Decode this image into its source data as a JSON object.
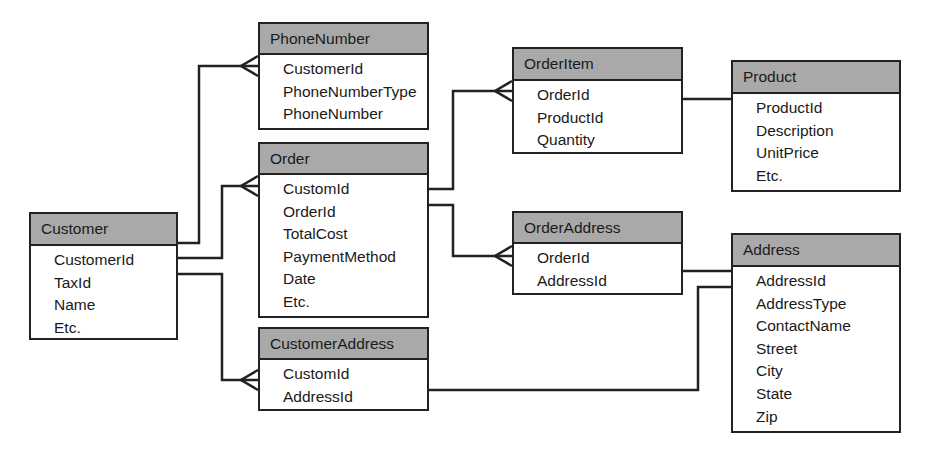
{
  "diagram": {
    "type": "entity-relationship",
    "entities": [
      {
        "id": "customer",
        "title": "Customer",
        "fields": [
          "CustomerId",
          "TaxId",
          "Name",
          "Etc."
        ],
        "box": {
          "x": 29,
          "y": 212,
          "w": 149,
          "h": 128,
          "header_h": 32
        }
      },
      {
        "id": "phonenumber",
        "title": "PhoneNumber",
        "fields": [
          "CustomerId",
          "PhoneNumberType",
          "PhoneNumber"
        ],
        "box": {
          "x": 258,
          "y": 22,
          "w": 171,
          "h": 108,
          "header_h": 31
        }
      },
      {
        "id": "order",
        "title": "Order",
        "fields": [
          "CustomId",
          "OrderId",
          "TotalCost",
          "PaymentMethod",
          "Date",
          "Etc."
        ],
        "box": {
          "x": 258,
          "y": 142,
          "w": 171,
          "h": 176,
          "header_h": 31
        }
      },
      {
        "id": "customeraddress",
        "title": "CustomerAddress",
        "fields": [
          "CustomId",
          "AddressId"
        ],
        "box": {
          "x": 258,
          "y": 327,
          "w": 171,
          "h": 84,
          "header_h": 31
        }
      },
      {
        "id": "orderitem",
        "title": "OrderItem",
        "fields": [
          "OrderId",
          "ProductId",
          "Quantity"
        ],
        "box": {
          "x": 512,
          "y": 47,
          "w": 171,
          "h": 107,
          "header_h": 32
        }
      },
      {
        "id": "orderaddress",
        "title": "OrderAddress",
        "fields": [
          "OrderId",
          "AddressId"
        ],
        "box": {
          "x": 512,
          "y": 211,
          "w": 171,
          "h": 84,
          "header_h": 31
        }
      },
      {
        "id": "product",
        "title": "Product",
        "fields": [
          "ProductId",
          "Description",
          "UnitPrice",
          "Etc."
        ],
        "box": {
          "x": 731,
          "y": 60,
          "w": 170,
          "h": 132,
          "header_h": 32
        }
      },
      {
        "id": "address",
        "title": "Address",
        "fields": [
          "AddressId",
          "AddressType",
          "ContactName",
          "Street",
          "City",
          "State",
          "Zip"
        ],
        "box": {
          "x": 731,
          "y": 233,
          "w": 170,
          "h": 200,
          "header_h": 32
        }
      }
    ],
    "relationships": [
      {
        "from": "Customer",
        "to": "PhoneNumber",
        "cardinality": "one-to-many",
        "path": "M178 243 H199 V66 H258",
        "crow": {
          "x": 258,
          "y": 66
        }
      },
      {
        "from": "Customer",
        "to": "Order",
        "cardinality": "one-to-many",
        "path": "M178 258 H222 V186 H258",
        "crow": {
          "x": 258,
          "y": 186
        }
      },
      {
        "from": "Customer",
        "to": "CustomerAddress",
        "cardinality": "one-to-many",
        "path": "M178 274 H222 V380 H258",
        "crow": {
          "x": 258,
          "y": 380
        }
      },
      {
        "from": "Order",
        "to": "OrderItem",
        "cardinality": "one-to-many",
        "path": "M429 189 H453 V91 H512",
        "crow": {
          "x": 512,
          "y": 91
        }
      },
      {
        "from": "Order",
        "to": "OrderAddress",
        "cardinality": "one-to-many",
        "path": "M429 205 H453 V256 H512",
        "crow": {
          "x": 512,
          "y": 256
        }
      },
      {
        "from": "OrderItem",
        "to": "Product",
        "cardinality": "one-to-one",
        "path": "M683 99 H731",
        "crow": null
      },
      {
        "from": "OrderAddress",
        "to": "Address",
        "cardinality": "one-to-one",
        "path": "M683 271 H731",
        "crow": null
      },
      {
        "from": "CustomerAddress",
        "to": "Address",
        "cardinality": "one-to-one",
        "path": "M429 390 H698 V287 H731",
        "crow": null
      }
    ]
  },
  "colors": {
    "header_fill": "#a9a9a9",
    "line": "#222222",
    "background": "#ffffff"
  }
}
